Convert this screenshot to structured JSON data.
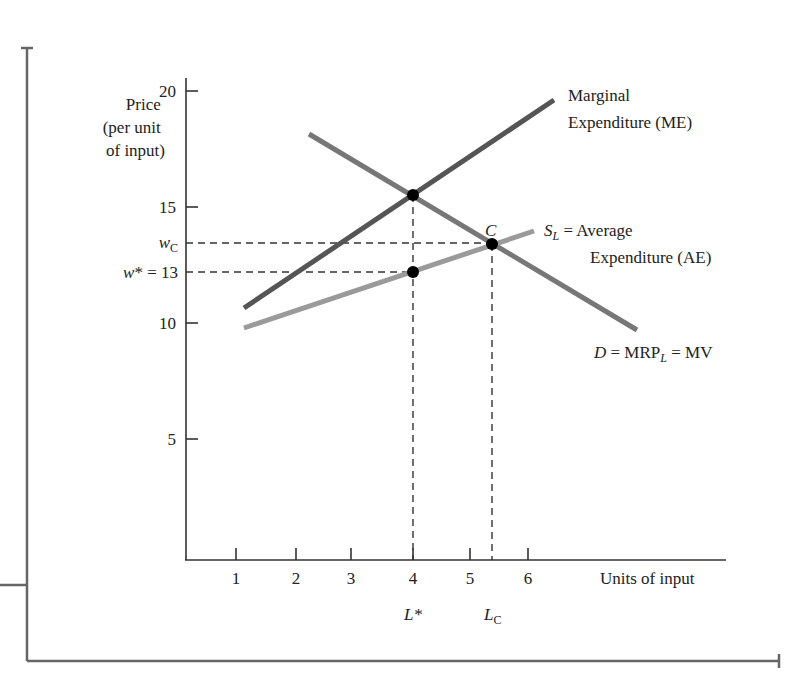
{
  "chart_data": {
    "type": "line",
    "title": "",
    "xlabel": "Units of input",
    "ylabel": "Price (per unit of input)",
    "ylabel_lines": [
      "Price",
      "(per unit",
      "of input)"
    ],
    "xlim": [
      0,
      7
    ],
    "ylim": [
      0,
      20
    ],
    "grid": false,
    "x_ticks": [
      1,
      2,
      3,
      4,
      5,
      6
    ],
    "y_ticks": [
      5,
      10,
      15,
      20
    ],
    "extra_y_labels": [
      {
        "label": "wC",
        "value": 14
      },
      {
        "label": "w* = 13",
        "value": 13
      }
    ],
    "extra_x_labels": [
      {
        "label": "L*",
        "value": 4
      },
      {
        "label": "LC",
        "value": 5.4
      }
    ],
    "series": [
      {
        "name": "Marginal Expenditure (ME)",
        "color": "#555555",
        "points": [
          [
            1.1,
            10.8
          ],
          [
            6.5,
            19.7
          ]
        ]
      },
      {
        "name": "D = MRP_L = MV",
        "color": "#777777",
        "points": [
          [
            2.3,
            18.6
          ],
          [
            7.4,
            10.1
          ]
        ]
      },
      {
        "name": "S_L = Average Expenditure (AE)",
        "color": "#9a9a9a",
        "points": [
          [
            1.1,
            9.9
          ],
          [
            6.1,
            14.0
          ]
        ]
      }
    ],
    "points_of_interest": [
      {
        "label": "",
        "x": 4,
        "y": 15.5,
        "desc": "ME = MRP intersection"
      },
      {
        "label": "C",
        "x": 5.4,
        "y": 14,
        "desc": "Competitive equilibrium"
      },
      {
        "label": "",
        "x": 4,
        "y": 13,
        "desc": "Monopsony wage on supply curve"
      }
    ],
    "annotations": {
      "me_label": [
        "Marginal",
        "Expenditure (ME)"
      ],
      "sl_label_sym": "S",
      "sl_label_sub": "L",
      "sl_label_rest": " = Average",
      "sl_label_line2": "Expenditure (AE)",
      "d_label_D": "D",
      "d_label_mid": " = MRP",
      "d_label_sub": "L",
      "d_label_end": " = MV",
      "c_label": "C",
      "wc_w": "w",
      "wc_sub": "C",
      "wstar": "w* = 13",
      "lstar": "L*",
      "lc_L": "L",
      "lc_sub": "C"
    }
  }
}
